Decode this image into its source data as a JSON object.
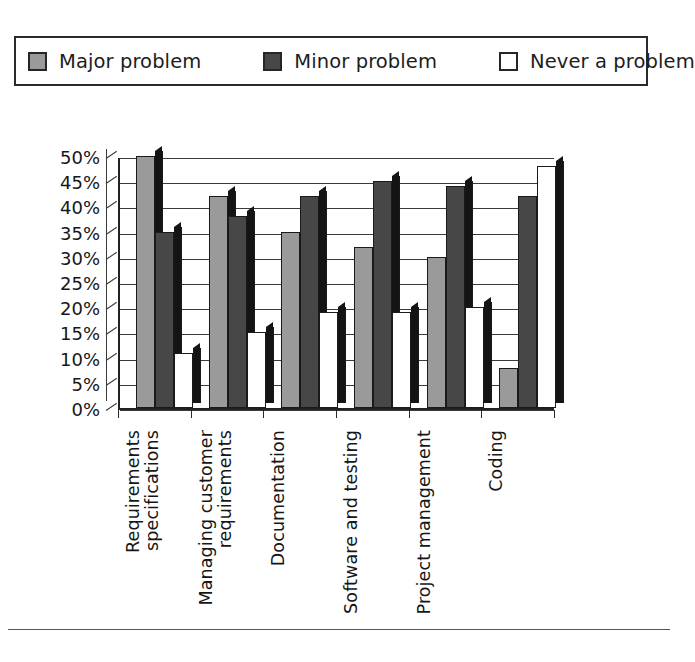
{
  "legend": {
    "items": [
      {
        "label": "Major problem",
        "color": "#9a9a9a",
        "swatch": "legend-swatch-major"
      },
      {
        "label": "Minor problem",
        "color": "#474747",
        "swatch": "legend-swatch-minor"
      },
      {
        "label": "Never a problem",
        "color": "#ffffff",
        "swatch": "legend-swatch-never"
      }
    ]
  },
  "axis": {
    "y_ticks": [
      "50%",
      "45%",
      "40%",
      "35%",
      "30%",
      "25%",
      "20%",
      "15%",
      "10%",
      "5%",
      "0%"
    ]
  },
  "chart_data": {
    "type": "bar",
    "title": "",
    "xlabel": "",
    "ylabel": "",
    "ylim": [
      0,
      50
    ],
    "ytick_step": 5,
    "grid": true,
    "legend_position": "top",
    "orientation": "vertical",
    "grouping": "grouped",
    "style": "3d-column",
    "value_unit": "percent",
    "categories": [
      "Requirements specifications",
      "Managing customer requirements",
      "Documentation",
      "Software and testing",
      "Project management",
      "Coding"
    ],
    "series": [
      {
        "name": "Major problem",
        "color": "#9a9a9a",
        "values": [
          50,
          42,
          35,
          32,
          30,
          8
        ]
      },
      {
        "name": "Minor problem",
        "color": "#474747",
        "values": [
          35,
          38,
          42,
          45,
          44,
          42
        ]
      },
      {
        "name": "Never a problem",
        "color": "#ffffff",
        "values": [
          11,
          15,
          19,
          19,
          20,
          48
        ]
      }
    ]
  }
}
